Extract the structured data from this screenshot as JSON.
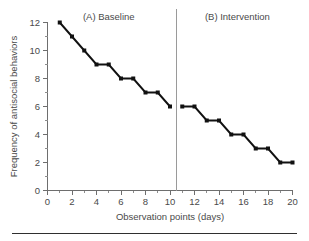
{
  "figure": {
    "rule_visible": true
  },
  "chart_data": {
    "type": "line",
    "title": "",
    "xlabel": "Observation points (days)",
    "ylabel": "Frequency of antisocial behaviors",
    "xlim": [
      0,
      20
    ],
    "ylim": [
      0,
      12
    ],
    "grid": false,
    "legend_position": "none",
    "x_tick_labels": [
      "0",
      "2",
      "4",
      "6",
      "8",
      "10",
      "12",
      "14",
      "16",
      "18",
      "20"
    ],
    "x_tick_values": [
      0,
      2,
      4,
      6,
      8,
      10,
      12,
      14,
      16,
      18,
      20
    ],
    "x_minor_tick_values": [
      1,
      3,
      5,
      7,
      9,
      11,
      13,
      15,
      17,
      19
    ],
    "y_tick_labels": [
      "0",
      "2",
      "4",
      "6",
      "8",
      "10",
      "12"
    ],
    "y_tick_values": [
      0,
      2,
      4,
      6,
      8,
      10,
      12
    ],
    "y_minor_tick_values": [
      1,
      3,
      5,
      7,
      9,
      11
    ],
    "marker": "square",
    "line_color": "#111111",
    "marker_color": "#111111",
    "phase_divider": {
      "x": 10.5,
      "color": "#9a9a9a"
    },
    "annotations": [
      {
        "text": "(A) Baseline",
        "x": 5.0,
        "y": 12.4
      },
      {
        "text": "(B) Intervention",
        "x": 15.5,
        "y": 12.4
      }
    ],
    "series": [
      {
        "name": "(A) Baseline",
        "x": [
          1,
          2,
          3,
          4,
          5,
          6,
          7,
          8,
          9,
          10
        ],
        "values": [
          12,
          11,
          10,
          9,
          9,
          8,
          8,
          7,
          7,
          6
        ]
      },
      {
        "name": "(B) Intervention",
        "x": [
          11,
          12,
          13,
          14,
          15,
          16,
          17,
          18,
          19,
          20
        ],
        "values": [
          6,
          6,
          5,
          5,
          4,
          4,
          3,
          3,
          2,
          2
        ]
      }
    ]
  }
}
